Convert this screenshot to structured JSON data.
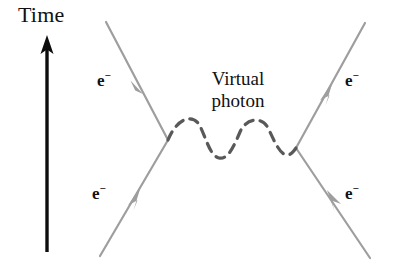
{
  "figure": {
    "width": 395,
    "height": 264,
    "background": "#ffffff"
  },
  "axis": {
    "time_label": "Time",
    "arrow_color": "#000000",
    "arrow_x": 47,
    "arrow_top_y": 38,
    "arrow_bottom_y": 252
  },
  "photon": {
    "label_line1": "Virtual",
    "label_line2": "photon",
    "color": "#5a5a5a",
    "style": "dashed-wave",
    "periods": 2,
    "amplitude": 16,
    "start_x": 168,
    "start_y": 140,
    "end_x": 296,
    "end_y": 148
  },
  "fermions": {
    "color": "#9e9e9e",
    "line_width": 2,
    "vertex_left": {
      "x": 168,
      "y": 140
    },
    "vertex_right": {
      "x": 296,
      "y": 148
    },
    "lines": [
      {
        "name": "incoming-upper-left",
        "x1": 106,
        "y1": 22,
        "x2": 168,
        "y2": 140,
        "arrow_dir": "toward-vertex"
      },
      {
        "name": "incoming-lower-left",
        "x1": 100,
        "y1": 256,
        "x2": 168,
        "y2": 140,
        "arrow_dir": "toward-vertex"
      },
      {
        "name": "outgoing-upper-right",
        "x1": 296,
        "y1": 148,
        "x2": 365,
        "y2": 23,
        "arrow_dir": "away-from-vertex"
      },
      {
        "name": "outgoing-lower-right",
        "x1": 296,
        "y1": 148,
        "x2": 370,
        "y2": 258,
        "arrow_dir": "toward-vertex"
      }
    ]
  },
  "particles": {
    "symbol": "e",
    "charge": "−",
    "labels": [
      {
        "id": "top-left",
        "symbol": "e",
        "charge": "−"
      },
      {
        "id": "bottom-left",
        "symbol": "e",
        "charge": "−"
      },
      {
        "id": "top-right",
        "symbol": "e",
        "charge": "−"
      },
      {
        "id": "bottom-right",
        "symbol": "e",
        "charge": "−"
      }
    ]
  }
}
